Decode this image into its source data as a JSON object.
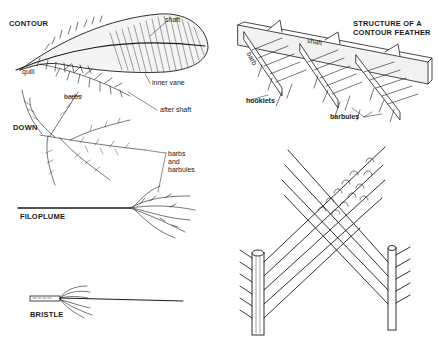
{
  "diagram": {
    "panels": [
      {
        "id": "contour",
        "caption": "CONTOUR",
        "labels": [
          "shaft",
          "quill",
          "inner vane",
          "after shaft"
        ]
      },
      {
        "id": "down",
        "caption": "DOWN",
        "labels": [
          "barbs"
        ]
      },
      {
        "id": "filoplume",
        "caption": "FILOPLUME",
        "labels": [
          "barbs and barbules"
        ]
      },
      {
        "id": "bristle",
        "caption": "BRISTLE",
        "labels": []
      },
      {
        "id": "structure",
        "caption": "STRUCTURE OF A CONTOUR FEATHER",
        "labels": [
          "shaft",
          "barb",
          "hooklets",
          "barbules"
        ]
      },
      {
        "id": "barbule-interlock",
        "caption": "",
        "labels": []
      }
    ]
  },
  "labels": {
    "contour_caption": "CONTOUR",
    "contour_shaft": "shaft",
    "contour_quill": "quill",
    "contour_inner_vane": "inner vane",
    "contour_after_shaft": "after shaft",
    "down_caption": "DOWN",
    "down_barbs": "barbs",
    "barbs_and_barbules": "barbs\nand\nbarbules",
    "filoplume_caption": "FILOPLUME",
    "bristle_caption": "BRISTLE",
    "structure_caption": "STRUCTURE OF A\nCONTOUR FEATHER",
    "structure_shaft": "shaft",
    "structure_barb": "barb",
    "structure_hooklets": "hooklets",
    "structure_barbules": "barbules"
  },
  "colors": {
    "ink": "#1a1a1a",
    "paper": "#ffffff"
  }
}
